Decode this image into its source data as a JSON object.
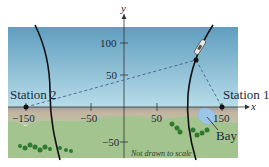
{
  "diagram": {
    "axes": {
      "x_label": "x",
      "y_label": "y",
      "x_ticks": [
        "−150",
        "−50",
        "50",
        "150"
      ],
      "y_ticks": [
        "100",
        "50",
        "−50"
      ]
    },
    "stations": [
      {
        "name": "Station 1",
        "x": 150,
        "y": 0
      },
      {
        "name": "Station 2",
        "x": -150,
        "y": 0
      }
    ],
    "features": {
      "bay_label": "Bay",
      "note": "Not drawn to scale"
    },
    "ship": {
      "approx_x": 110,
      "approx_y": 45
    },
    "colors": {
      "sky_top": "#5f9ebf",
      "sky_bottom": "#a9d3e4",
      "sand": "#b7aa98",
      "grass": "#9dc08b",
      "bushes": "#2f7a2f",
      "bay": "#9cc6e6",
      "curve": "#111111",
      "dashed": "#3f5f8a"
    }
  }
}
